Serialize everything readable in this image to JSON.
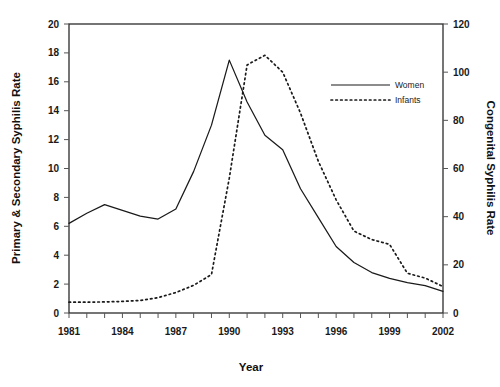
{
  "chart_data": {
    "type": "line",
    "title": "",
    "xlabel": "Year",
    "ylabel": "Primary & Secondary Syphilis Rate",
    "y2label": "Congenital Syphilis Rate",
    "grid": false,
    "legend_position": "upper-right-inside",
    "xlim": [
      1981,
      2002
    ],
    "ylim": [
      0,
      20
    ],
    "y2lim": [
      0,
      120
    ],
    "x": [
      1981,
      1982,
      1983,
      1984,
      1985,
      1986,
      1987,
      1988,
      1989,
      1990,
      1991,
      1992,
      1993,
      1994,
      1995,
      1996,
      1997,
      1998,
      1999,
      2000,
      2001,
      2002
    ],
    "xticks": [
      1981,
      1982,
      1983,
      1984,
      1985,
      1986,
      1987,
      1988,
      1989,
      1990,
      1991,
      1992,
      1993,
      1994,
      1995,
      1996,
      1997,
      1998,
      1999,
      2000,
      2001,
      2002
    ],
    "xtick_labels": [
      "1981",
      "",
      "",
      "1984",
      "",
      "",
      "1987",
      "",
      "",
      "1990",
      "",
      "",
      "1993",
      "",
      "",
      "1996",
      "",
      "",
      "1999",
      "",
      "",
      "2002"
    ],
    "yticks": [
      0,
      2,
      4,
      6,
      8,
      10,
      12,
      14,
      16,
      18,
      20
    ],
    "ytick_labels": [
      "0",
      "2",
      "4",
      "6",
      "8",
      "10",
      "12",
      "14",
      "16",
      "18",
      "20"
    ],
    "y2ticks": [
      0,
      20,
      40,
      60,
      80,
      100,
      120
    ],
    "y2tick_labels": [
      "0",
      "20",
      "40",
      "60",
      "80",
      "100",
      "120"
    ],
    "series": [
      {
        "name": "Women",
        "axis": "left",
        "style": "solid",
        "color": "#1a1a1a",
        "values": [
          6.2,
          6.9,
          7.5,
          7.1,
          6.7,
          6.5,
          7.2,
          9.8,
          13.0,
          17.5,
          14.6,
          12.3,
          11.3,
          8.6,
          6.6,
          4.6,
          3.5,
          2.8,
          2.4,
          2.1,
          1.9,
          1.5
        ]
      },
      {
        "name": "Infants",
        "axis": "right",
        "style": "dotted",
        "color": "#1a1a1a",
        "values": [
          4.5,
          4.5,
          4.6,
          4.8,
          5.2,
          6.4,
          8.5,
          11.5,
          16.0,
          56.0,
          103.0,
          107.0,
          100.0,
          83.0,
          63.0,
          47.0,
          34.0,
          30.5,
          28.5,
          16.5,
          14.5,
          11.0
        ]
      }
    ]
  },
  "legend": {
    "items": [
      {
        "label": "Women",
        "style": "solid"
      },
      {
        "label": "Infants",
        "style": "dotted"
      }
    ]
  }
}
